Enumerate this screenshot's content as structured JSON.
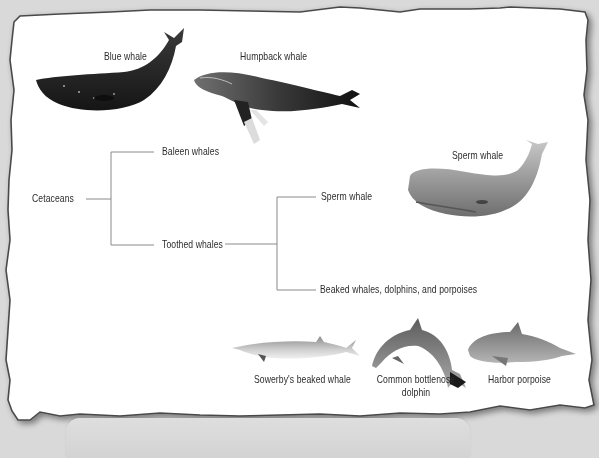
{
  "diagram": {
    "root": "Cetaceans",
    "branches": [
      {
        "label": "Baleen whales"
      },
      {
        "label": "Toothed whales",
        "children": [
          {
            "label": "Sperm whale"
          },
          {
            "label": "Beaked whales, dolphins, and porpoises"
          }
        ]
      }
    ]
  },
  "illustrations": {
    "blue_whale": "Blue whale",
    "humpback_whale": "Humpback whale",
    "sperm_whale": "Sperm whale",
    "sowerbys_beaked_whale": "Sowerby's beaked whale",
    "bottlenose_dolphin_line1": "Common bottlenose",
    "bottlenose_dolphin_line2": "dolphin",
    "harbor_porpoise": "Harbor porpoise"
  },
  "colors": {
    "background": "#d9d9d9",
    "paper": "#ffffff",
    "paper_border": "#4a4a4a",
    "tree_lines": "#8a8a8a",
    "label_text": "#2b2b2b"
  }
}
